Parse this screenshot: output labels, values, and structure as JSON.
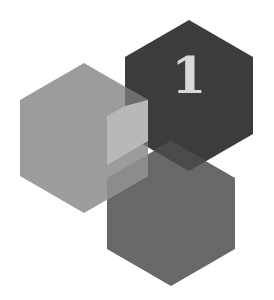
{
  "logo": {
    "numeral": "1",
    "colors": {
      "background": "#ffffff",
      "dark_hex": "#3c3c3c",
      "left_hex": "#9c9c9c",
      "lower_hex": "#686868",
      "overlap_left_dark": "#6e6e6e",
      "overlap_left_lower": "#8c8c8c",
      "overlap_all_light": "#b8b8b8",
      "overlap_dark_lower": "#4a4a4a",
      "numeral": "#d8d8d8"
    }
  }
}
